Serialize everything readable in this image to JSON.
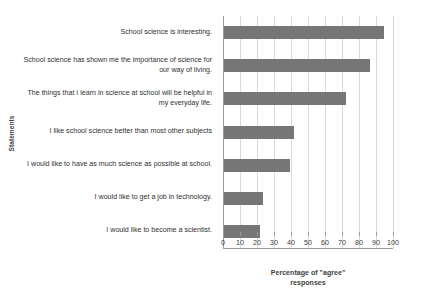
{
  "chart_data": {
    "type": "bar",
    "orientation": "horizontal",
    "title": "",
    "xlabel": "Percentage of \"agree\" responses",
    "ylabel": "Statements",
    "xlim": [
      0,
      100
    ],
    "xticks": [
      "0",
      "10",
      "20",
      "30",
      "40",
      "50",
      "60",
      "70",
      "80",
      "90",
      "100"
    ],
    "grid": "vertical",
    "legend": "none",
    "bar_color": "#767676",
    "categories": [
      "School science is interesting.",
      "School science has shown me the importance of science for our way of living.",
      "The things that I learn in science at school will be helpful in my everyday life.",
      "I like school science better than most other subjects",
      "I would like to have as much science as possible at school.",
      "I would like to get a job in technology.",
      "I would like to become a scientist."
    ],
    "values": [
      94,
      86,
      72,
      41,
      39,
      23,
      21
    ]
  },
  "axis": {
    "x_title_line1": "Percentage of \"agree\"",
    "x_title_line2": "responses",
    "y_title": "Statements"
  }
}
